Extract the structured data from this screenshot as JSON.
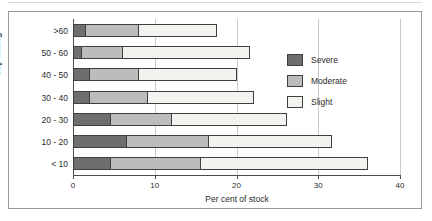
{
  "chart_data": {
    "type": "bar",
    "orientation": "horizontal",
    "stacked": true,
    "title": "",
    "xlabel": "Per cent of stock",
    "ylabel": "Sap rating",
    "xlim": [
      0,
      40
    ],
    "xticks": [
      0,
      10,
      20,
      30,
      40
    ],
    "xtick_labels": [
      "0",
      "10",
      "20",
      "30",
      "40"
    ],
    "grid": "vertical",
    "legend_position": "right-inside",
    "categories": [
      ">60",
      "50 - 60",
      "40 - 50",
      "30 - 40",
      "20 - 30",
      "10 - 20",
      "< 10"
    ],
    "series": [
      {
        "name": "Severe",
        "color": "#6e6e6e",
        "values": [
          1.5,
          1.0,
          2.0,
          2.0,
          4.5,
          6.5,
          4.5
        ]
      },
      {
        "name": "Moderate",
        "color": "#bcbcbc",
        "values": [
          6.5,
          5.0,
          6.0,
          7.0,
          7.5,
          10.0,
          11.0
        ]
      },
      {
        "name": "Slight",
        "color": "#f2f2ef",
        "values": [
          9.5,
          15.5,
          12.0,
          13.0,
          14.0,
          15.0,
          20.5
        ]
      }
    ],
    "totals": [
      17.5,
      21.5,
      20.0,
      22.0,
      26.0,
      31.5,
      36.0
    ]
  },
  "legend": {
    "items": [
      {
        "label": "Severe"
      },
      {
        "label": "Moderate"
      },
      {
        "label": "Slight"
      }
    ]
  }
}
